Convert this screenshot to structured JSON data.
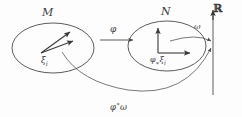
{
  "diagram": {
    "domain_ellipse": {
      "label": "M",
      "vector_label_base": "ξ",
      "vector_label_sub": "i"
    },
    "codomain_ellipse": {
      "label": "N",
      "pushforward_base": "φ",
      "pushforward_star": "∗",
      "pushforward_vec": "ξ",
      "pushforward_sub": "i"
    },
    "map_arrow": {
      "label": "φ"
    },
    "form_arrow": {
      "label": "ω"
    },
    "pullback_arrow": {
      "base": "φ",
      "star": "∗",
      "form": "ω"
    },
    "axis": {
      "label": "ℝ"
    },
    "colors": {
      "stroke": "#4a4a4a",
      "text": "#3c3c3c",
      "background": "#fdfdfd"
    }
  }
}
